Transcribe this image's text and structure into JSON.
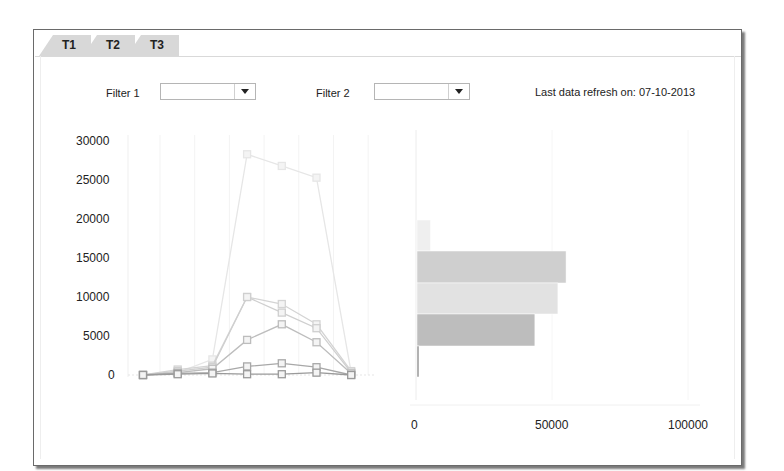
{
  "tabs": [
    {
      "label": "T1"
    },
    {
      "label": "T2"
    },
    {
      "label": "T3"
    }
  ],
  "filters": [
    {
      "label": "Filter 1",
      "value": ""
    },
    {
      "label": "Filter 2",
      "value": ""
    }
  ],
  "refresh": {
    "text": "Last data refresh on: 07-10-2013"
  },
  "colors": {
    "frame": "#6a6a6a",
    "tab": "#d8d8d8",
    "grid": "#efefef"
  },
  "chart_data": [
    {
      "type": "line",
      "title": "",
      "xlabel": "",
      "ylabel": "",
      "ylim": [
        0,
        30000
      ],
      "y_ticks": [
        "30000",
        "25000",
        "20000",
        "15000",
        "10000",
        "5000",
        "0"
      ],
      "x": [
        1,
        2,
        3,
        4,
        5,
        6,
        7
      ],
      "grid": true,
      "series": [
        {
          "name": "Series 1",
          "color": "#e6e6e6",
          "values": [
            0,
            300,
            2000,
            28300,
            26800,
            25300,
            300
          ]
        },
        {
          "name": "Series 2",
          "color": "#d4d4d4",
          "values": [
            0,
            700,
            1200,
            10000,
            9100,
            6500,
            500
          ]
        },
        {
          "name": "Series 3",
          "color": "#cfcfcf",
          "values": [
            0,
            500,
            1000,
            10000,
            8000,
            6000,
            300
          ]
        },
        {
          "name": "Series 4",
          "color": "#bdbdbd",
          "values": [
            0,
            300,
            800,
            4500,
            6500,
            4200,
            200
          ]
        },
        {
          "name": "Series 5",
          "color": "#a8a8a8",
          "values": [
            0,
            200,
            300,
            1100,
            1500,
            1000,
            0
          ]
        },
        {
          "name": "Series 6",
          "color": "#9a9a9a",
          "values": [
            0,
            100,
            200,
            100,
            100,
            300,
            0
          ]
        }
      ]
    },
    {
      "type": "bar",
      "orientation": "horizontal",
      "title": "",
      "xlabel": "",
      "ylabel": "",
      "xlim": [
        0,
        100000
      ],
      "x_ticks": [
        "0",
        "50000",
        "100000"
      ],
      "categories": [
        "A",
        "B",
        "C",
        "D",
        "E",
        "F"
      ],
      "values": [
        0,
        5000,
        55000,
        52000,
        43500,
        600
      ],
      "colors": [
        "#eeeeee",
        "#efefef",
        "#cfcfcf",
        "#e2e2e2",
        "#bdbdbd",
        "#999999"
      ]
    }
  ]
}
